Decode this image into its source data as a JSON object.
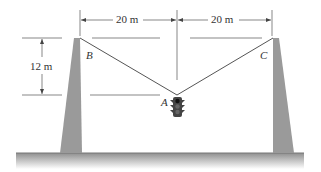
{
  "diagram": {
    "dimensions": {
      "left_span": "20 m",
      "right_span": "20 m",
      "height": "12 m"
    },
    "points": {
      "B": "B",
      "C": "C",
      "A": "A"
    },
    "colors": {
      "pole": "#9a9a9a",
      "cable": "#555555",
      "ground": "#a8a8a8",
      "dim_line": "#555555",
      "traffic_light": "#444444"
    }
  }
}
